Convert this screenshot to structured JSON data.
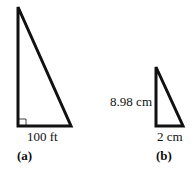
{
  "figures": [
    {
      "id": "a",
      "caption": "(a)",
      "base_label": "100 ft",
      "height_label": "",
      "right_angle_marker": true,
      "vertices": {
        "apex": [
          18,
          7
        ],
        "bottom_left": [
          18,
          126
        ],
        "bottom_right": [
          71,
          126
        ]
      }
    },
    {
      "id": "b",
      "caption": "(b)",
      "base_label": "2 cm",
      "height_label": "8.98 cm",
      "right_angle_marker": false,
      "vertices": {
        "apex": [
          156,
          67
        ],
        "bottom_left": [
          156,
          126
        ],
        "bottom_right": [
          183,
          126
        ]
      }
    }
  ],
  "colors": {
    "stroke": "#111111",
    "background": "#ffffff"
  }
}
